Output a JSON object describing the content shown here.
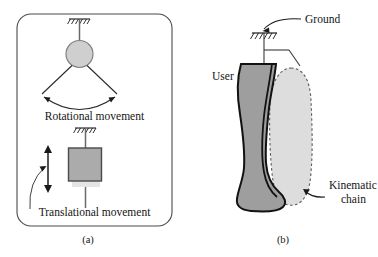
{
  "figure": {
    "panels": [
      {
        "id": "a",
        "caption": "(a)",
        "labels": {
          "rotational": "Rotational movement",
          "translational": "Translational movement"
        },
        "elements": {
          "ground_symbol_top": "ground-hatch-icon",
          "pivot_joint": "revolute-joint-circle",
          "swing_arc": "rotation-arc-double-arrow",
          "prismatic_block": "prismatic-joint-block",
          "slide_arrow": "vertical-double-arrow",
          "ground_symbol_mid": "ground-hatch-icon",
          "callout_leader": "curved-leader-line"
        }
      },
      {
        "id": "b",
        "caption": "(b)",
        "labels": {
          "ground": "Ground",
          "user": "User",
          "kinematic_chain_line1": "Kinematic",
          "kinematic_chain_line2": "chain"
        },
        "elements": {
          "ground_symbol": "ground-hatch-icon",
          "leg_silhouette": "user-leg-shape",
          "chain_silhouette": "kinematic-chain-shape",
          "ground_leader": "curved-arrow-leader",
          "chain_leader": "curved-arrow-leader",
          "link_lines": "connection-lines"
        }
      }
    ],
    "colors": {
      "stroke": "#1a1a1a",
      "leg_fill": "#9a9a9a",
      "chain_fill": "#dcdcdc",
      "chain_dash": "#555555",
      "joint_fill": "#cccccc",
      "block_dark": "#a8a8a8",
      "block_light": "#e2e2e2",
      "panel_border": "#4a4a4a",
      "background": "#ffffff"
    }
  }
}
